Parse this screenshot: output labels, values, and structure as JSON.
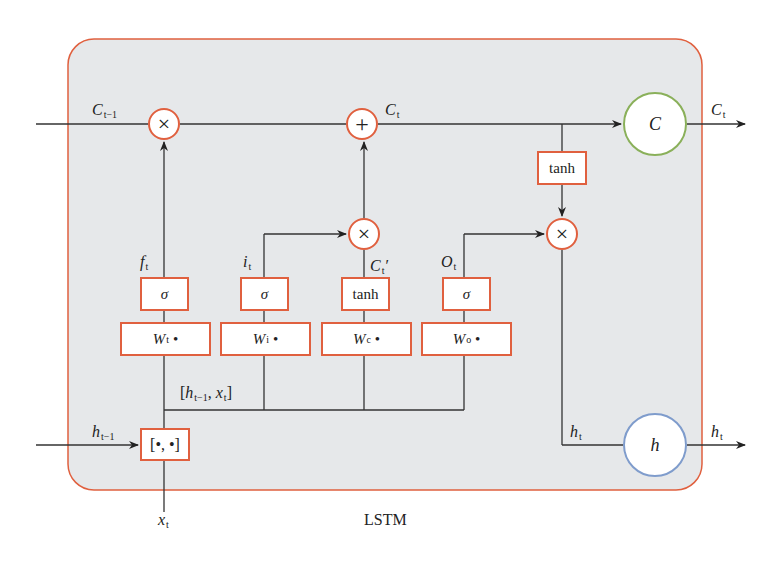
{
  "diagram": {
    "caption": "LSTM",
    "colors": {
      "cell_background": "#e6e8ea",
      "cell_border": "#e0603f",
      "op_border": "#e0603f",
      "state_c_border": "#8ab05a",
      "state_h_border": "#7f9ccc",
      "line": "#333333"
    },
    "inputs": {
      "c_prev": {
        "main": "C",
        "sub": "t−1"
      },
      "h_prev": {
        "main": "h",
        "sub": "t−1"
      },
      "x_t": {
        "main": "x",
        "sub": "t"
      }
    },
    "outputs": {
      "c_t": {
        "main": "C",
        "sub": "t"
      },
      "h_t": {
        "main": "h",
        "sub": "t"
      }
    },
    "labels": {
      "c_t_mid": {
        "main": "C",
        "sub": "t"
      },
      "f_t": {
        "main": "f",
        "sub": "t"
      },
      "i_t": {
        "main": "i",
        "sub": "t"
      },
      "c_t_prime": {
        "main": "C",
        "sub": "t",
        "suffix": "′"
      },
      "o_t": {
        "main": "O",
        "sub": "t"
      },
      "h_t_inner": {
        "main": "h",
        "sub": "t"
      },
      "concat_label": {
        "open": "[",
        "h": "h",
        "h_sub": "t−1",
        "sep": ", ",
        "x": "x",
        "x_sub": "t",
        "close": "]"
      }
    },
    "ops": {
      "forget_mult": "×",
      "add": "+",
      "input_mult": "×",
      "output_mult": "×"
    },
    "activations": {
      "forget": "σ",
      "input": "σ",
      "candidate": "tanh",
      "output": "σ",
      "cell_out": "tanh"
    },
    "weights": [
      {
        "main": "W",
        "sub": "t",
        "dot": "•"
      },
      {
        "main": "W",
        "sub": "i",
        "dot": "•"
      },
      {
        "main": "W",
        "sub": "c",
        "dot": "•"
      },
      {
        "main": "W",
        "sub": "o",
        "dot": "•"
      }
    ],
    "concat_box": "[•, •]",
    "state_nodes": {
      "c": "C",
      "h": "h"
    }
  }
}
